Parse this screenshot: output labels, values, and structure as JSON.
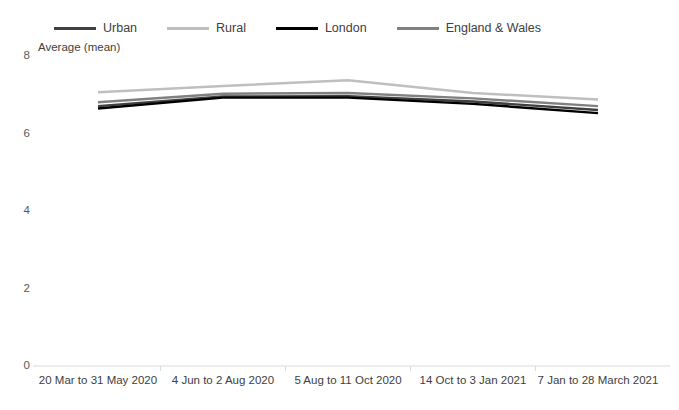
{
  "chart_data": {
    "type": "line",
    "title": "",
    "xlabel": "",
    "ylabel": "Average (mean)",
    "ylim": [
      0,
      8
    ],
    "yticks": [
      0,
      2,
      4,
      6,
      8
    ],
    "grid": false,
    "legend_position": "top",
    "categories": [
      "20 Mar to 31 May 2020",
      "4 Jun to 2 Aug 2020",
      "5 Aug to 11 Oct 2020",
      "14 Oct to 3 Jan 2021",
      "7 Jan to 28 March 2021"
    ],
    "series": [
      {
        "name": "Urban",
        "color": "#404040",
        "values": [
          6.68,
          6.93,
          6.94,
          6.8,
          6.58
        ]
      },
      {
        "name": "Rural",
        "color": "#bfbfbf",
        "values": [
          7.04,
          7.2,
          7.35,
          7.02,
          6.85
        ]
      },
      {
        "name": "London",
        "color": "#000000",
        "values": [
          6.62,
          6.9,
          6.9,
          6.74,
          6.5
        ]
      },
      {
        "name": "England & Wales",
        "color": "#808080",
        "values": [
          6.78,
          7.0,
          7.02,
          6.88,
          6.68
        ]
      }
    ]
  },
  "axis": {
    "ylabel": "Average (mean)",
    "ytick_labels": [
      "8",
      "6",
      "4",
      "2",
      "0"
    ],
    "xtick_labels": [
      "20 Mar to 31 May 2020",
      "4 Jun to 2 Aug 2020",
      "5 Aug to 11 Oct 2020",
      "14 Oct to 3 Jan 2021",
      "7 Jan to 28 March 2021"
    ]
  },
  "legend": {
    "items": [
      {
        "label": "Urban",
        "color": "#404040"
      },
      {
        "label": "Rural",
        "color": "#bfbfbf"
      },
      {
        "label": "London",
        "color": "#000000"
      },
      {
        "label": "England & Wales",
        "color": "#808080"
      }
    ]
  },
  "colors": {
    "urban": "#404040",
    "rural": "#bfbfbf",
    "london": "#000000",
    "england_wales": "#808080",
    "axis": "#d9d9d9",
    "text": "#404040"
  }
}
